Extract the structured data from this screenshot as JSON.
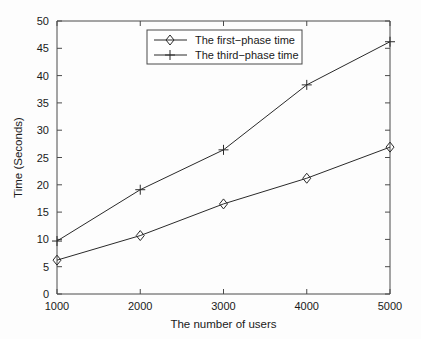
{
  "chart_data": {
    "type": "line",
    "title": "",
    "xlabel": "The number of users",
    "ylabel": "Time (Seconds)",
    "x": [
      1000,
      2000,
      3000,
      4000,
      5000
    ],
    "xtick_labels": [
      "1000",
      "2000",
      "3000",
      "4000",
      "5000"
    ],
    "ytick_labels": [
      "0",
      "5",
      "10",
      "15",
      "20",
      "25",
      "30",
      "35",
      "40",
      "45",
      "50"
    ],
    "ytick_values": [
      0,
      5,
      10,
      15,
      20,
      25,
      30,
      35,
      40,
      45,
      50
    ],
    "xlim": [
      1000,
      5000
    ],
    "ylim": [
      0,
      50
    ],
    "grid": false,
    "legend_position": "top-center",
    "series": [
      {
        "name": "The first−phase time",
        "marker": "diamond",
        "color": "#2a2a2a",
        "values": [
          6.2,
          10.7,
          16.5,
          21.2,
          26.9
        ]
      },
      {
        "name": "The third−phase time",
        "marker": "plus",
        "color": "#2a2a2a",
        "values": [
          9.7,
          19.1,
          26.4,
          38.3,
          46.2
        ]
      }
    ]
  },
  "legend": {
    "entries": [
      {
        "label": "The first−phase time"
      },
      {
        "label": "The third−phase time"
      }
    ]
  },
  "axes": {
    "x_title": "The number of users",
    "y_title": "Time (Seconds)",
    "x_ticks": [
      "1000",
      "2000",
      "3000",
      "4000",
      "5000"
    ],
    "y_ticks": [
      "0",
      "5",
      "10",
      "15",
      "20",
      "25",
      "30",
      "35",
      "40",
      "45",
      "50"
    ]
  },
  "colors": {
    "line": "#2a2a2a",
    "axis": "#4a4a4a",
    "text": "#1a1a1a",
    "background": "#fdfdfd",
    "legend_background": "#ffffff"
  }
}
